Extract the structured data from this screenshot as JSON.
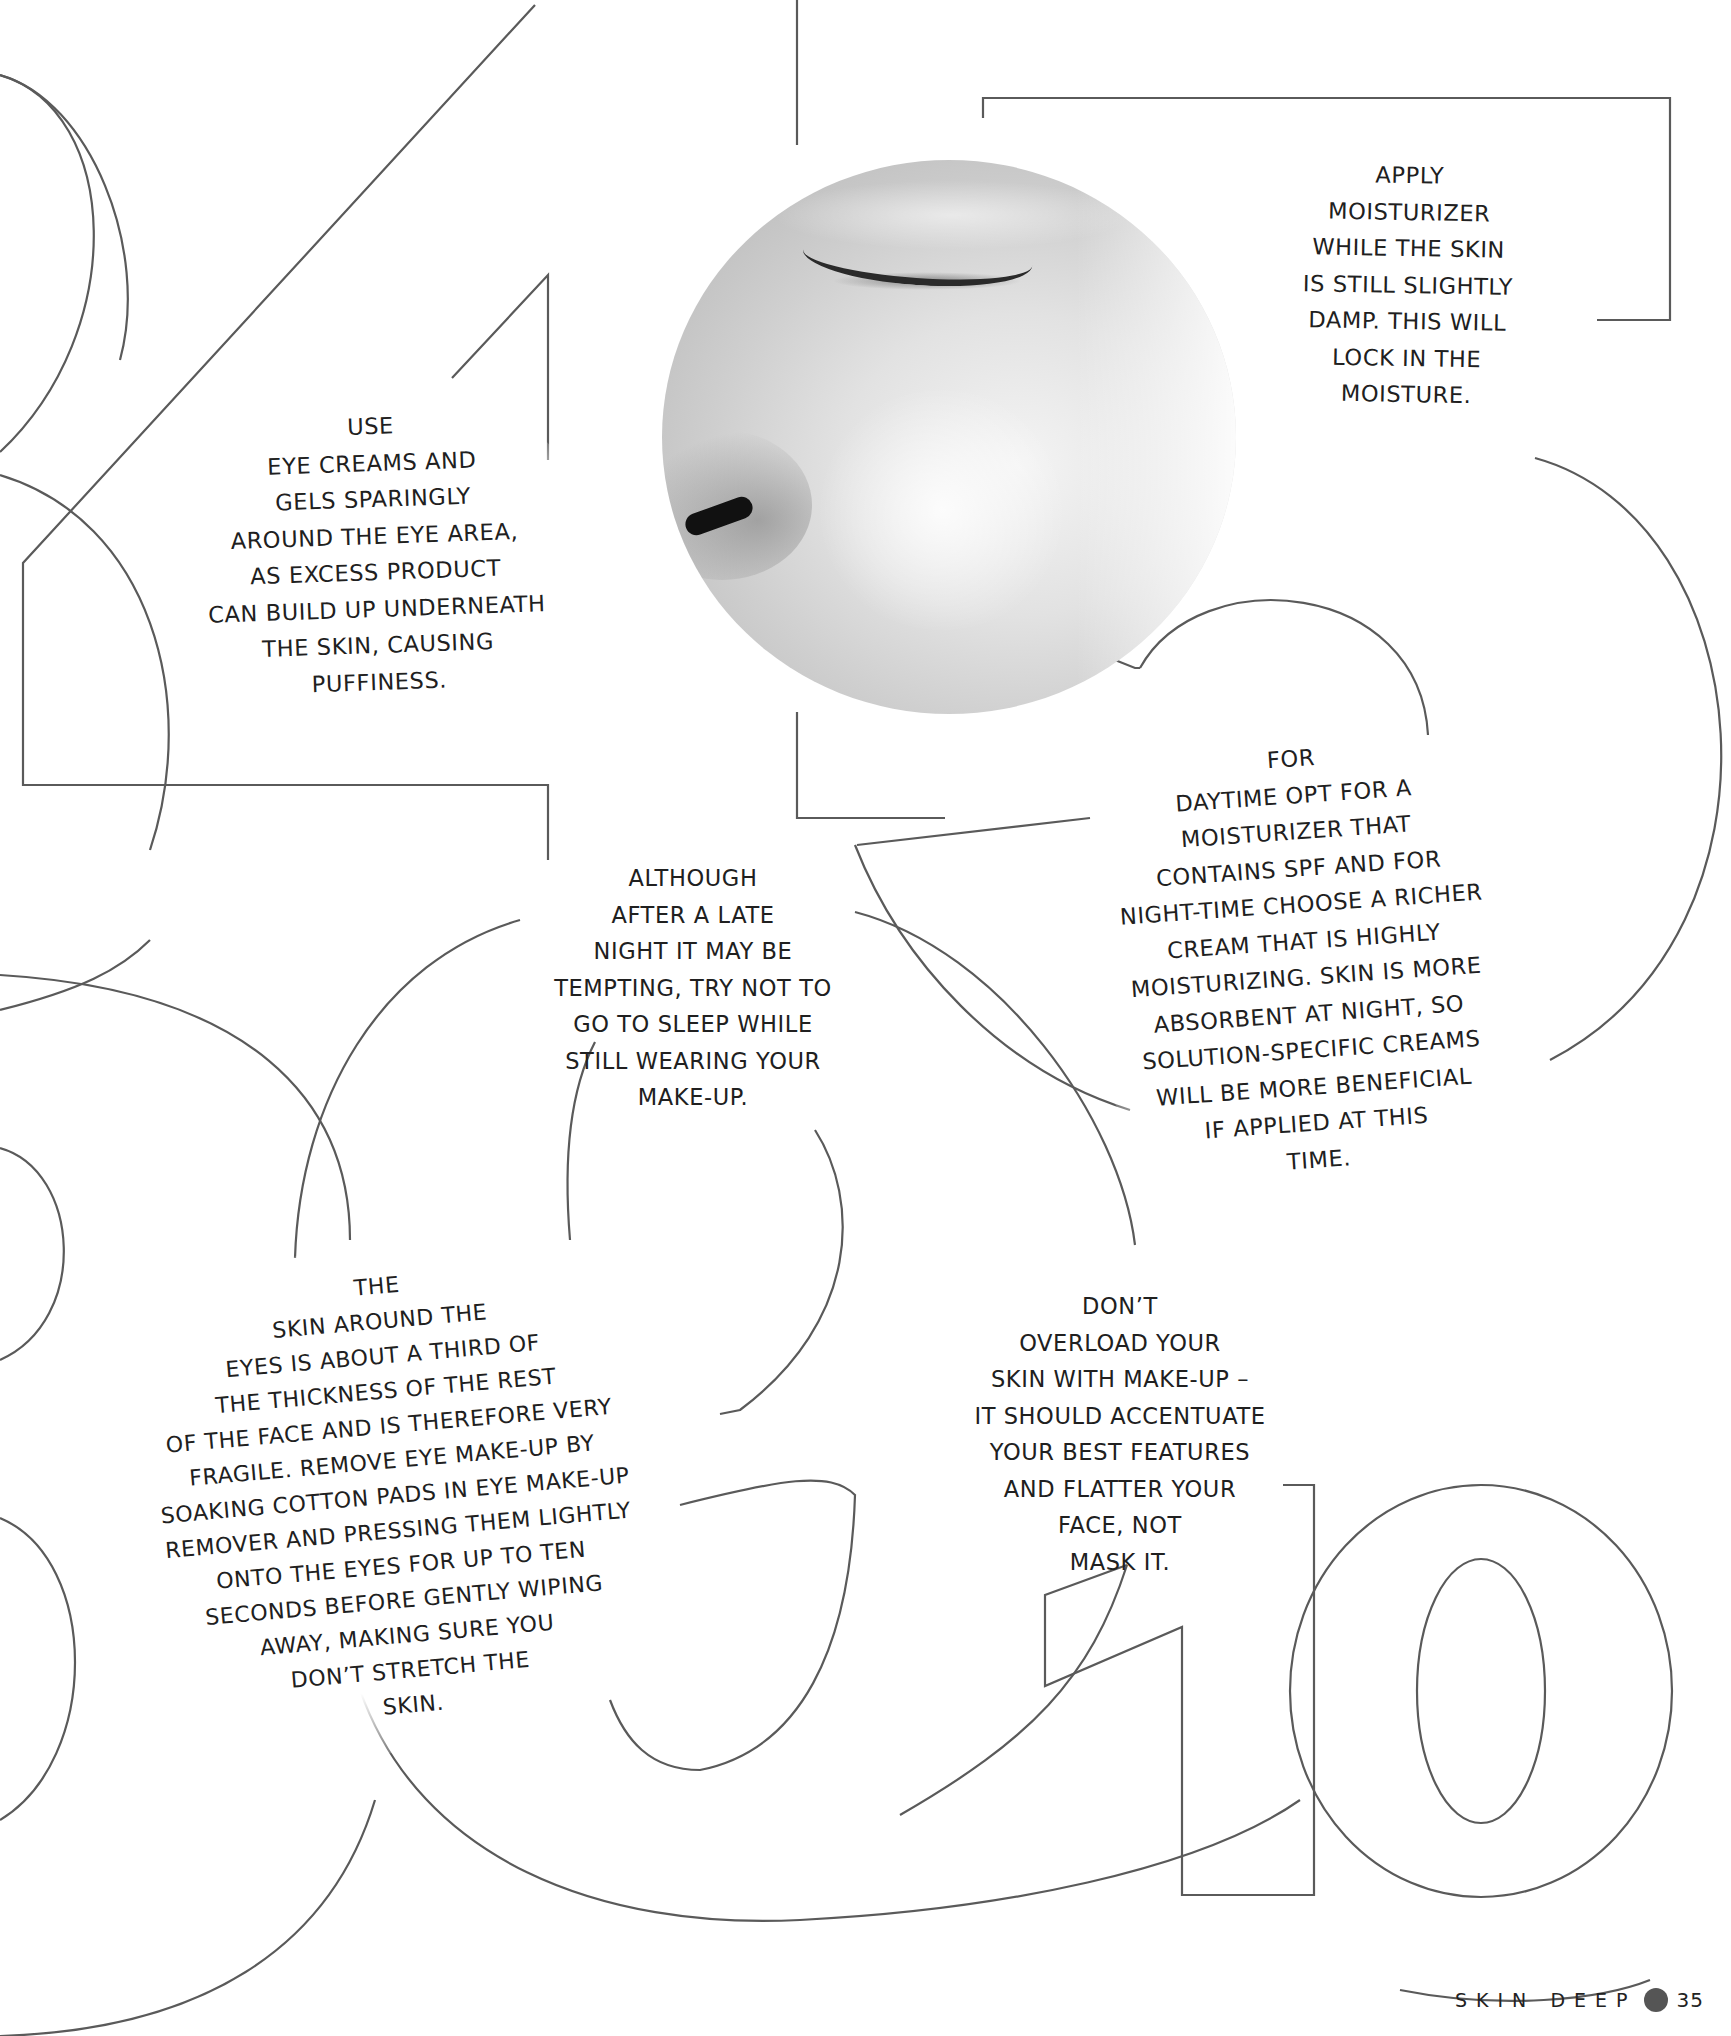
{
  "page": {
    "section_title": "SKIN DEEP",
    "page_number": "35",
    "accent_dot_color": "#555555",
    "outline_stroke_color": "#5a5a5a"
  },
  "decorative_numerals": [
    "3",
    "4",
    "5",
    "8",
    "9",
    "10"
  ],
  "photo": {
    "subject": "close-up of closed eye, nose and cheek (black and white)",
    "shape": "circle"
  },
  "tips": [
    {
      "id": "eye-creams",
      "lines": [
        "USE",
        "EYE CREAMS AND",
        "GELS SPARINGLY",
        "AROUND THE EYE AREA,",
        "AS EXCESS PRODUCT",
        "CAN BUILD UP UNDERNEATH",
        "THE SKIN, CAUSING",
        "PUFFINESS."
      ]
    },
    {
      "id": "damp-skin",
      "lines": [
        "APPLY",
        "MOISTURIZER",
        "WHILE THE SKIN",
        "IS STILL SLIGHTLY",
        "DAMP. THIS WILL",
        "LOCK IN THE",
        "MOISTURE."
      ]
    },
    {
      "id": "sleep-makeup",
      "lines": [
        "ALTHOUGH",
        "AFTER A LATE",
        "NIGHT IT MAY BE",
        "TEMPTING, TRY NOT TO",
        "GO TO SLEEP WHILE",
        "STILL WEARING YOUR",
        "MAKE-UP."
      ]
    },
    {
      "id": "day-night-cream",
      "lines": [
        "FOR",
        "DAYTIME OPT FOR A",
        "MOISTURIZER THAT",
        "CONTAINS SPF AND FOR",
        "NIGHT-TIME CHOOSE A RICHER",
        "CREAM THAT IS HIGHLY",
        "MOISTURIZING. SKIN IS MORE",
        "ABSORBENT AT NIGHT, SO",
        "SOLUTION-SPECIFIC CREAMS",
        "WILL BE MORE BENEFICIAL",
        "IF APPLIED AT THIS",
        "TIME."
      ]
    },
    {
      "id": "eye-skin",
      "lines": [
        "THE",
        "SKIN AROUND THE",
        "EYES IS ABOUT A THIRD OF",
        "THE THICKNESS OF THE REST",
        "OF THE FACE AND IS THEREFORE VERY",
        "FRAGILE. REMOVE EYE MAKE-UP BY",
        "SOAKING COTTON PADS IN EYE MAKE-UP",
        "REMOVER AND PRESSING THEM LIGHTLY",
        "ONTO THE EYES FOR UP TO TEN",
        "SECONDS BEFORE GENTLY WIPING",
        "AWAY, MAKING SURE YOU",
        "DON’T STRETCH THE",
        "SKIN."
      ]
    },
    {
      "id": "overload",
      "lines": [
        "DON’T",
        "OVERLOAD YOUR",
        "SKIN WITH MAKE-UP –",
        "IT SHOULD ACCENTUATE",
        "YOUR BEST FEATURES",
        "AND FLATTER YOUR",
        "FACE, NOT",
        "MASK IT."
      ]
    }
  ]
}
